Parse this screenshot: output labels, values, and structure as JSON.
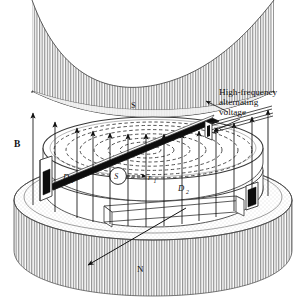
{
  "figure": {
    "type": "physics-line-diagram",
    "background_color": "#ffffff",
    "ink_color": "#111111",
    "hatch_color": "#8a8a8a",
    "stipple_color": "#bdbdbd"
  },
  "labels": {
    "pole_top": "S",
    "pole_bottom": "N",
    "field": "B",
    "dee_left": "D",
    "dee_left_sub": "1",
    "dee_right": "D",
    "dee_right_sub": "2",
    "source": "S",
    "radius": "r",
    "radius_sub": "1"
  },
  "callout": {
    "line1": "High-frequency",
    "line2": "alternating",
    "line3": "voltage"
  },
  "components": {
    "top_pole_name": "upper magnet pole piece",
    "bottom_pole_name": "lower magnet pole piece",
    "dee_left_name": "dee chamber D1",
    "dee_right_name": "dee chamber D2",
    "source_name": "ion source S",
    "beam_name": "extracted beam arrow",
    "feedline_name": "rf transmission line",
    "spiral_name": "spiral ion trajectory",
    "field_arrows_name": "magnetic field arrows"
  }
}
